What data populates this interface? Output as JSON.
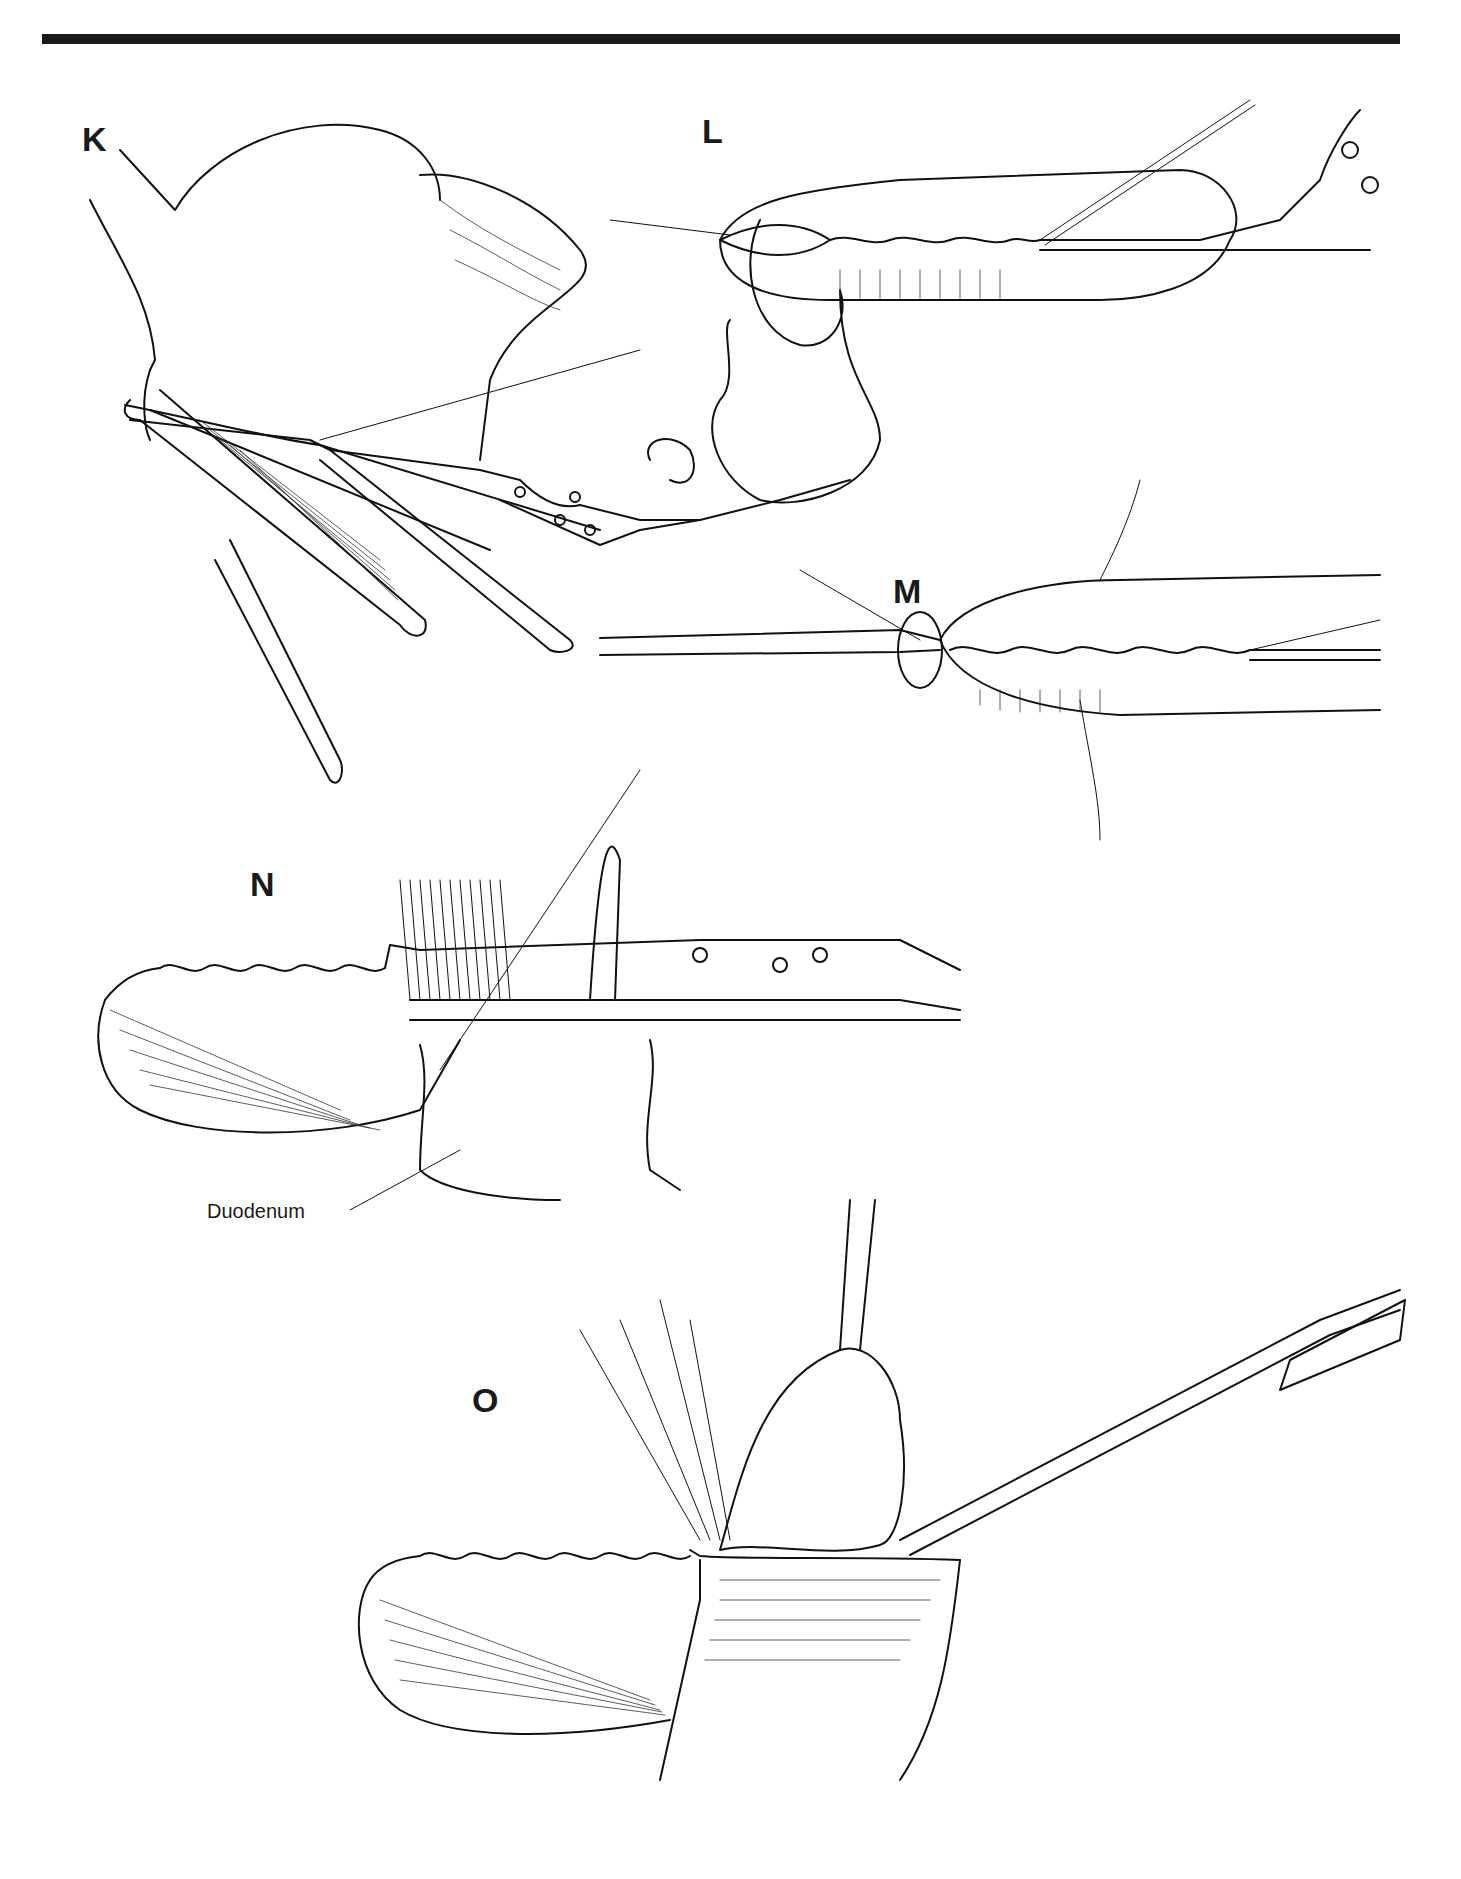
{
  "figure": {
    "panels": [
      {
        "id": "K",
        "label": "K"
      },
      {
        "id": "L",
        "label": "L"
      },
      {
        "id": "M",
        "label": "M"
      },
      {
        "id": "N",
        "label": "N"
      },
      {
        "id": "O",
        "label": "O"
      }
    ],
    "annotations": [
      {
        "panel": "N",
        "text": "Duodenum"
      }
    ]
  }
}
